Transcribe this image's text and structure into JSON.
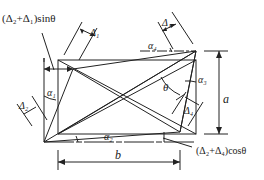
{
  "diagram": {
    "labels": {
      "top_left_formula": "(Δ₂+Δ₁)sinθ",
      "bottom_right_formula": "(Δ₂+Δ₄)cosθ",
      "delta1_top_left": "Δ₁",
      "delta1_top_right": "Δ₁",
      "delta2_left": "Δ₂",
      "delta4_right": "Δ₄",
      "alpha1": "α₁",
      "alpha2": "α₂",
      "alpha3": "α₃",
      "alpha4": "α₄",
      "theta": "θ",
      "dim_a": "a",
      "dim_b": "b"
    },
    "colors": {
      "line": "#222222",
      "background": "#ffffff"
    }
  }
}
